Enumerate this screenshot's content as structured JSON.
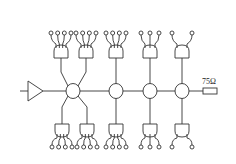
{
  "diagram": {
    "type": "cable-distribution-schematic",
    "stroke_color": "#333333",
    "background": "#ffffff",
    "amplifier": {
      "label": ""
    },
    "terminator": {
      "label": "75Ω"
    },
    "main_line_y": 91,
    "taps": [
      {
        "id": "tap-1",
        "cx": 73,
        "branches": "split",
        "upper": [
          {
            "cx": 61,
            "outputs": 4
          },
          {
            "cx": 86,
            "outputs": 4
          }
        ],
        "lower": [
          {
            "cx": 62,
            "outputs": 4
          },
          {
            "cx": 87,
            "outputs": 4
          }
        ]
      },
      {
        "id": "tap-2",
        "cx": 116,
        "branches": "single",
        "upper": [
          {
            "cx": 116,
            "outputs": 4
          }
        ],
        "lower": [
          {
            "cx": 116,
            "outputs": 4
          }
        ]
      },
      {
        "id": "tap-3",
        "cx": 150,
        "branches": "single",
        "upper": [
          {
            "cx": 150,
            "outputs": 3
          }
        ],
        "lower": [
          {
            "cx": 150,
            "outputs": 3
          }
        ]
      },
      {
        "id": "tap-4",
        "cx": 182,
        "branches": "single",
        "upper": [
          {
            "cx": 182,
            "outputs": 2
          }
        ],
        "lower": [
          {
            "cx": 182,
            "outputs": 2
          }
        ]
      }
    ]
  }
}
